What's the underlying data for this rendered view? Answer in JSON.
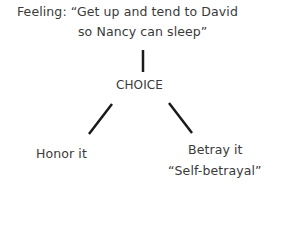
{
  "diagram": {
    "feeling": {
      "line1": "Feeling: “Get up and tend to David",
      "line2": "so Nancy can sleep”"
    },
    "choice_label": "CHOICE",
    "branches": [
      {
        "label": "Honor it",
        "sublabel": ""
      },
      {
        "label": "Betray it",
        "sublabel": "“Self-betrayal”"
      }
    ],
    "colors": {
      "text": "#3a3a3a",
      "line": "#1a1a1a",
      "background": "#ffffff"
    }
  }
}
